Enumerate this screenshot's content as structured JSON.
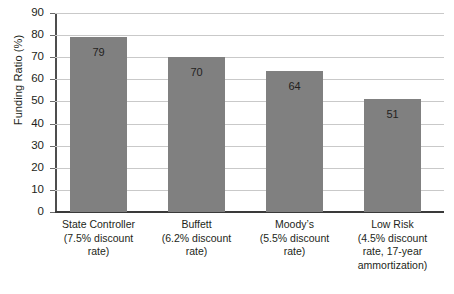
{
  "chart_data": {
    "type": "bar",
    "title": "",
    "xlabel": "",
    "ylabel": "Funding Ratio (%)",
    "ylim": [
      0,
      90
    ],
    "ytick_step": 10,
    "grid": true,
    "legend": "none",
    "bar_color": "#808080",
    "gridline_color": "#c9c9c9",
    "axis_color": "#3a3a3a",
    "categories": [
      "State Controller",
      "Buffett",
      "Moody’s",
      "Low Risk"
    ],
    "category_sublabels": [
      [
        "(7.5% discount",
        "rate)"
      ],
      [
        "(6.2% discount",
        "rate)"
      ],
      [
        "(5.5% discount",
        "rate)"
      ],
      [
        "(4.5% discount",
        "rate, 17-year",
        "ammortization)"
      ]
    ],
    "values": [
      79,
      70,
      64,
      51
    ],
    "value_labels": [
      "79",
      "70",
      "64",
      "51"
    ],
    "ytick_labels": [
      "90",
      "80",
      "70",
      "60",
      "50",
      "40",
      "30",
      "20",
      "10",
      "0"
    ],
    "ytick_values": [
      90,
      80,
      70,
      60,
      50,
      40,
      30,
      20,
      10,
      0
    ]
  }
}
